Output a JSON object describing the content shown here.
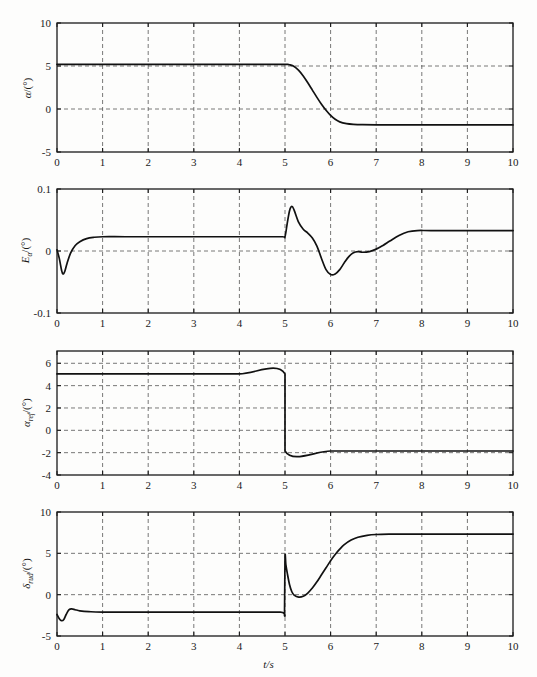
{
  "figure": {
    "background": "#fdfdfc",
    "curve_color": "#111111",
    "grid_color": "#555555",
    "xlabel": "t/s",
    "width": 537,
    "height": 677
  },
  "chart_data": [
    {
      "type": "line",
      "panel_index": 0,
      "title": "",
      "xlabel": "",
      "ylabel": "α/(°)",
      "ylabel_symbol": "α",
      "ylabel_sub": "",
      "ylabel_unit": "/(°)",
      "xlim": [
        0,
        10
      ],
      "ylim": [
        -5,
        10
      ],
      "xticks": [
        0,
        1,
        2,
        3,
        4,
        5,
        6,
        7,
        8,
        9,
        10
      ],
      "yticks": [
        -5,
        0,
        5,
        10
      ],
      "xticklabels": [
        "0",
        "1",
        "2",
        "3",
        "4",
        "5",
        "6",
        "7",
        "8",
        "9",
        "10"
      ],
      "yticklabels": [
        "-5",
        "0",
        "5",
        "10"
      ],
      "grid": true,
      "series": [
        {
          "name": "alpha",
          "x": [
            0,
            0.3,
            0.8,
            1.5,
            2.5,
            3.5,
            4.4,
            4.9,
            5.0,
            5.05,
            5.1,
            5.2,
            5.3,
            5.4,
            5.5,
            5.6,
            5.7,
            5.8,
            5.9,
            6.0,
            6.1,
            6.2,
            6.35,
            6.5,
            6.7,
            7.0,
            7.5,
            8.0,
            9.0,
            10.0
          ],
          "y": [
            5.2,
            5.2,
            5.2,
            5.2,
            5.2,
            5.2,
            5.2,
            5.2,
            5.2,
            5.19,
            5.15,
            4.95,
            4.5,
            3.85,
            3.05,
            2.2,
            1.35,
            0.55,
            -0.15,
            -0.75,
            -1.2,
            -1.5,
            -1.7,
            -1.78,
            -1.82,
            -1.84,
            -1.85,
            -1.85,
            -1.85,
            -1.85
          ]
        }
      ]
    },
    {
      "type": "line",
      "panel_index": 1,
      "title": "",
      "xlabel": "",
      "ylabel": "E_α/(°)",
      "ylabel_symbol": "E",
      "ylabel_sub": "α",
      "ylabel_unit": "/(°)",
      "xlim": [
        0,
        10
      ],
      "ylim": [
        -0.1,
        0.1
      ],
      "xticks": [
        0,
        1,
        2,
        3,
        4,
        5,
        6,
        7,
        8,
        9,
        10
      ],
      "yticks": [
        -0.1,
        0,
        0.1
      ],
      "xticklabels": [
        "0",
        "1",
        "2",
        "3",
        "4",
        "5",
        "6",
        "7",
        "8",
        "9",
        "10"
      ],
      "yticklabels": [
        "-0.1",
        "0",
        "0.1"
      ],
      "grid": true,
      "series": [
        {
          "name": "E_alpha",
          "x": [
            0,
            0.05,
            0.1,
            0.13,
            0.17,
            0.22,
            0.3,
            0.4,
            0.5,
            0.65,
            0.8,
            1.0,
            1.5,
            2.5,
            3.5,
            4.5,
            4.95,
            5.0,
            5.05,
            5.1,
            5.15,
            5.2,
            5.3,
            5.4,
            5.5,
            5.6,
            5.7,
            5.8,
            5.9,
            6.0,
            6.1,
            6.2,
            6.3,
            6.4,
            6.5,
            6.6,
            6.7,
            6.85,
            7.0,
            7.15,
            7.3,
            7.5,
            7.7,
            7.9,
            8.2,
            9.0,
            10.0
          ],
          "y": [
            0.002,
            -0.012,
            -0.031,
            -0.037,
            -0.033,
            -0.02,
            -0.003,
            0.009,
            0.015,
            0.02,
            0.022,
            0.023,
            0.023,
            0.023,
            0.023,
            0.023,
            0.023,
            0.023,
            0.045,
            0.065,
            0.072,
            0.066,
            0.046,
            0.035,
            0.029,
            0.021,
            0.008,
            -0.012,
            -0.03,
            -0.038,
            -0.037,
            -0.03,
            -0.019,
            -0.009,
            -0.003,
            -0.001,
            -0.002,
            -0.001,
            0.003,
            0.009,
            0.016,
            0.025,
            0.031,
            0.033,
            0.033,
            0.033,
            0.033
          ]
        }
      ]
    },
    {
      "type": "line",
      "panel_index": 2,
      "title": "",
      "xlabel": "",
      "ylabel": "α_ref/(°)",
      "ylabel_symbol": "α",
      "ylabel_sub": "ref",
      "ylabel_unit": "/(°)",
      "xlim": [
        0,
        10
      ],
      "ylim": [
        -4,
        7.1
      ],
      "xticks": [
        0,
        1,
        2,
        3,
        4,
        5,
        6,
        7,
        8,
        9,
        10
      ],
      "yticks": [
        -4,
        -2,
        0,
        2,
        4,
        6
      ],
      "xticklabels": [
        "0",
        "1",
        "2",
        "3",
        "4",
        "5",
        "6",
        "7",
        "8",
        "9",
        "10"
      ],
      "yticklabels": [
        "-4",
        "-2",
        "0",
        "2",
        "4",
        "6"
      ],
      "grid": true,
      "series": [
        {
          "name": "alpha_ref",
          "x": [
            0,
            1,
            2,
            3,
            4,
            5,
            5.0001,
            6,
            7,
            8,
            9,
            10
          ],
          "y": [
            5.05,
            5.05,
            5.05,
            5.05,
            5.05,
            5.05,
            -1.85,
            -1.85,
            -1.85,
            -1.85,
            -1.85,
            -1.85
          ]
        }
      ]
    },
    {
      "type": "line",
      "panel_index": 3,
      "title": "",
      "xlabel": "t/s",
      "ylabel": "δ_rud/(°)",
      "ylabel_symbol": "δ",
      "ylabel_sub": "rud",
      "ylabel_unit": "/(°)",
      "xlim": [
        0,
        10
      ],
      "ylim": [
        -5,
        10
      ],
      "xticks": [
        0,
        1,
        2,
        3,
        4,
        5,
        6,
        7,
        8,
        9,
        10
      ],
      "yticks": [
        -5,
        0,
        5,
        10
      ],
      "xticklabels": [
        "0",
        "1",
        "2",
        "3",
        "4",
        "5",
        "6",
        "7",
        "8",
        "9",
        "10"
      ],
      "yticklabels": [
        "-5",
        "0",
        "5",
        "10"
      ],
      "grid": true,
      "series": [
        {
          "name": "delta_rud",
          "x": [
            0,
            0.05,
            0.1,
            0.15,
            0.2,
            0.26,
            0.32,
            0.4,
            0.5,
            0.7,
            1.0,
            2.0,
            3.0,
            4.0,
            4.9,
            4.99,
            5.0,
            5.02,
            5.05,
            5.1,
            5.15,
            5.2,
            5.3,
            5.4,
            5.5,
            5.6,
            5.7,
            5.8,
            5.9,
            6.0,
            6.1,
            6.2,
            6.3,
            6.45,
            6.6,
            6.8,
            7.0,
            7.3,
            7.6,
            8.0,
            9.0,
            10.0
          ],
          "y": [
            -2.4,
            -2.9,
            -3.15,
            -3.0,
            -2.4,
            -1.85,
            -1.72,
            -1.82,
            -1.95,
            -2.05,
            -2.1,
            -2.1,
            -2.1,
            -2.1,
            -2.1,
            -2.1,
            4.6,
            3.6,
            2.6,
            1.2,
            0.35,
            -0.05,
            -0.3,
            -0.2,
            0.2,
            0.8,
            1.55,
            2.4,
            3.25,
            4.1,
            4.85,
            5.5,
            6.05,
            6.6,
            6.95,
            7.18,
            7.28,
            7.32,
            7.33,
            7.33,
            7.33,
            7.33
          ]
        }
      ]
    }
  ]
}
